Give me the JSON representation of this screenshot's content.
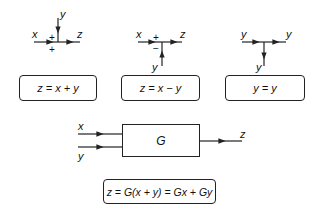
{
  "summing_junction": {
    "inputs": {
      "x": "x",
      "y": "y"
    },
    "output": "z",
    "signs": {
      "left": "+",
      "bottom": "+"
    },
    "equation": "z = x + y"
  },
  "difference_junction": {
    "inputs": {
      "x": "x",
      "y": "y"
    },
    "output": "z",
    "signs": {
      "top": "+",
      "bottom": "−"
    },
    "equation": "z = x − y"
  },
  "takeoff_point": {
    "input": "y",
    "outputs": {
      "right": "y",
      "down": "y"
    },
    "equation": "y = y"
  },
  "block": {
    "label": "G",
    "inputs": {
      "x": "x",
      "y": "y"
    },
    "output": "z",
    "equation": "z = G(x + y) = Gx + Gy"
  },
  "colors": {
    "stroke": "#222222",
    "background": "#ffffff"
  }
}
